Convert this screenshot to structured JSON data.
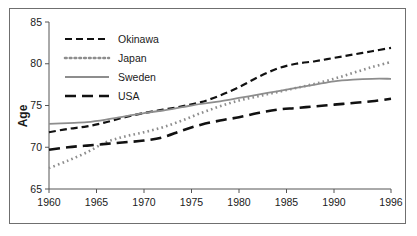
{
  "chart_data": {
    "type": "line",
    "title": "",
    "subtitle": "",
    "xlabel": "",
    "ylabel": "Age",
    "xlim": [
      1960,
      1996
    ],
    "ylim": [
      65,
      85
    ],
    "grid": false,
    "legend_position": "top-left",
    "x_ticks": [
      "1960",
      "1965",
      "1970",
      "1975",
      "1980",
      "1985",
      "1990",
      "1996"
    ],
    "x_tick_values": [
      1960,
      1965,
      1970,
      1975,
      1980,
      1985,
      1990,
      1996
    ],
    "y_ticks": [
      "65",
      "70",
      "75",
      "80",
      "85"
    ],
    "y_tick_values": [
      65,
      70,
      75,
      80,
      85
    ],
    "x": [
      1960,
      1962,
      1964,
      1966,
      1968,
      1970,
      1972,
      1974,
      1976,
      1978,
      1980,
      1982,
      1984,
      1986,
      1988,
      1990,
      1992,
      1994,
      1996
    ],
    "series": [
      {
        "name": "Okinawa",
        "color": "#111111",
        "style": "dashed",
        "values": [
          71.8,
          72.2,
          72.5,
          73.0,
          73.6,
          74.1,
          74.5,
          74.9,
          75.4,
          76.2,
          77.2,
          78.4,
          79.4,
          80.0,
          80.3,
          80.7,
          81.1,
          81.5,
          81.9
        ]
      },
      {
        "name": "Japan",
        "color": "#8d8d8d",
        "style": "dotted",
        "values": [
          67.5,
          68.4,
          69.4,
          70.6,
          71.3,
          71.8,
          72.4,
          73.2,
          74.1,
          74.9,
          75.6,
          76.1,
          76.6,
          77.1,
          77.6,
          78.2,
          78.9,
          79.6,
          80.2
        ]
      },
      {
        "name": "Sweden",
        "color": "#8d8d8d",
        "style": "solid",
        "values": [
          72.8,
          72.9,
          73.0,
          73.3,
          73.7,
          74.1,
          74.4,
          74.8,
          75.2,
          75.5,
          75.9,
          76.3,
          76.7,
          77.1,
          77.5,
          77.9,
          78.1,
          78.2,
          78.2
        ]
      },
      {
        "name": "USA",
        "color": "#111111",
        "style": "longdash",
        "values": [
          69.7,
          70.0,
          70.2,
          70.4,
          70.6,
          70.8,
          71.2,
          72.0,
          72.7,
          73.2,
          73.6,
          74.1,
          74.5,
          74.7,
          74.9,
          75.1,
          75.3,
          75.5,
          75.8
        ]
      }
    ],
    "legend": [
      {
        "label": "Okinawa",
        "color": "#111111",
        "style": "dashed"
      },
      {
        "label": "Japan",
        "color": "#8d8d8d",
        "style": "dotted"
      },
      {
        "label": "Sweden",
        "color": "#8d8d8d",
        "style": "solid"
      },
      {
        "label": "USA",
        "color": "#111111",
        "style": "longdash"
      }
    ],
    "colors": {
      "okinawa": "#111111",
      "japan": "#8d8d8d",
      "sweden": "#8d8d8d",
      "usa": "#111111",
      "axis": "#555555",
      "frame": "#6f6f6f",
      "text": "#1a1a1a",
      "background": "#ffffff"
    }
  }
}
